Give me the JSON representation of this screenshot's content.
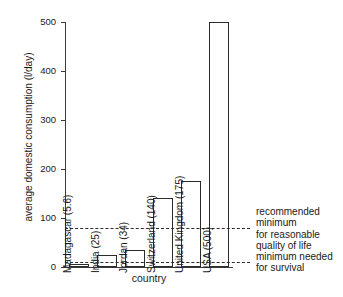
{
  "chart_data": {
    "type": "bar",
    "title": "",
    "xlabel": "country",
    "ylabel": "average domestic consumption (l/day)",
    "ylim": [
      0,
      500
    ],
    "yticks": [
      0,
      100,
      200,
      300,
      400,
      500
    ],
    "grid": false,
    "legend": "none",
    "categories": [
      "Madagascar",
      "India",
      "Jordan",
      "Switzerland",
      "United Kingdom",
      "USA"
    ],
    "values": [
      5.6,
      25,
      34,
      140,
      175,
      500
    ],
    "bar_labels": [
      "Madagascar (5.6)",
      "India (25)",
      "Jordan (34)",
      "Switzerland (140)",
      "United Kingdom (175)",
      "USA (500)"
    ],
    "reference_lines": [
      {
        "name": "recommended-minimum",
        "value": 80,
        "label": "recommended\nminimum\nfor reasonable\nquality of life",
        "style": "dashed"
      },
      {
        "name": "survival-minimum",
        "value": 10,
        "label": "minimum needed\nfor survival",
        "style": "dashed"
      }
    ]
  },
  "colors": {
    "bar_fill": "#ffffff",
    "bar_stroke": "#2b2b2b",
    "axis": "#3a3a3a",
    "text": "#1a1a1a",
    "background": "#ffffff"
  }
}
